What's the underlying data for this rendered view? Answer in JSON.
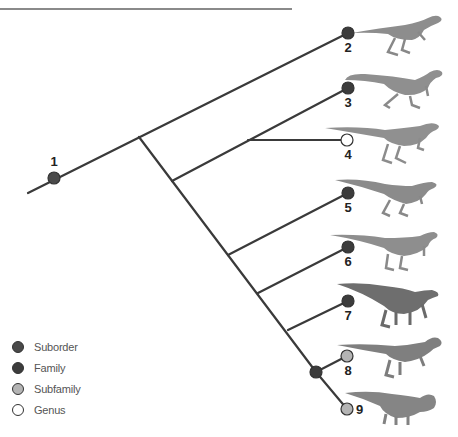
{
  "colors": {
    "line": "#3a3a3a",
    "suborder": "#4a4a4a",
    "family": "#3c3c3c",
    "subfamily": "#b4b4b4",
    "genus": "#ffffff",
    "dino_body": "#8d8d8d",
    "dino_dark": "#6a6a6a",
    "top_rule": "#8a8a8a"
  },
  "nodes": [
    {
      "id": "1",
      "label": "1",
      "type": "suborder"
    },
    {
      "id": "2",
      "label": "2",
      "type": "family"
    },
    {
      "id": "3",
      "label": "3",
      "type": "family"
    },
    {
      "id": "4",
      "label": "4",
      "type": "genus"
    },
    {
      "id": "5",
      "label": "5",
      "type": "family"
    },
    {
      "id": "6",
      "label": "6",
      "type": "family"
    },
    {
      "id": "7",
      "label": "7",
      "type": "family"
    },
    {
      "id": "8",
      "label": "8",
      "type": "subfamily"
    },
    {
      "id": "9",
      "label": "9",
      "type": "subfamily"
    },
    {
      "id": "8-9-join",
      "label": "",
      "type": "family"
    }
  ],
  "legend": [
    {
      "label": "Suborder",
      "type": "suborder"
    },
    {
      "label": "Family",
      "type": "family"
    },
    {
      "label": "Subfamily",
      "type": "subfamily"
    },
    {
      "label": "Genus",
      "type": "genus"
    }
  ]
}
